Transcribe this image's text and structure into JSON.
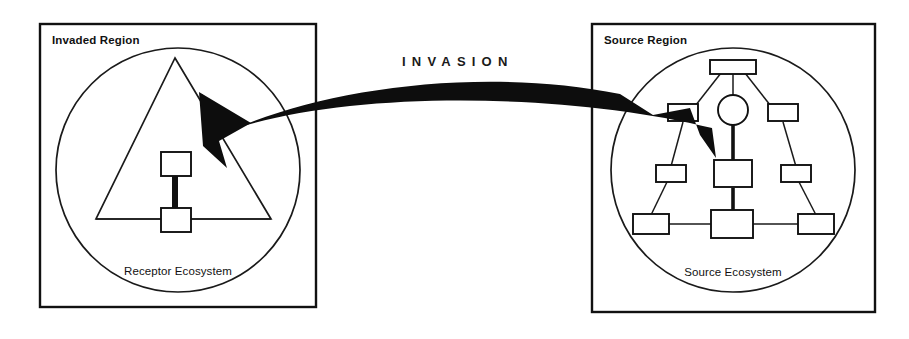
{
  "figure": {
    "title_text": "INVASION",
    "background": "#ffffff",
    "ink_color": "#111111",
    "arrow_color": "#0d0d0d",
    "width": 909,
    "height": 339
  },
  "left_panel": {
    "region_label": "Invaded Region",
    "ecosystem_label": "Receptor Ecosystem",
    "node_count": 2,
    "shape": "triangle-outline"
  },
  "right_panel": {
    "region_label": "Source Region",
    "ecosystem_label": "Source Ecosystem",
    "node_count": 10,
    "shape": "triangular-network"
  },
  "arrow": {
    "label": "INVASION",
    "direction": "right-to-left",
    "head": "left-pointing",
    "tail": "notched-ribbon"
  }
}
